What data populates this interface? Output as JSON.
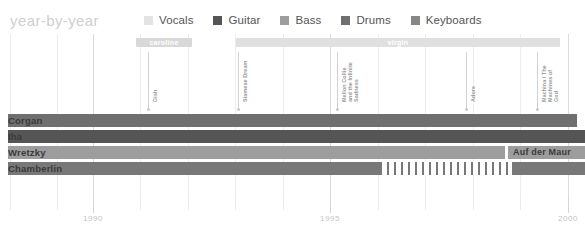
{
  "header": {
    "title": "year-by-year",
    "legend": [
      {
        "label": "Vocals",
        "color": "#e3e3e3"
      },
      {
        "label": "Guitar",
        "color": "#555555"
      },
      {
        "label": "Bass",
        "color": "#9d9d9d"
      },
      {
        "label": "Drums",
        "color": "#6f6f6f"
      },
      {
        "label": "Keyboards",
        "color": "#878787"
      }
    ]
  },
  "labels_bars": [
    {
      "name": "caroline",
      "x": 136,
      "width": 56,
      "color": "#d8d8d8"
    },
    {
      "name": "virgin",
      "x": 236,
      "width": 324,
      "color": "#e0e0e0"
    }
  ],
  "albums": [
    {
      "title": "Gish",
      "x": 148,
      "y_text": 56,
      "lines": 1
    },
    {
      "title": "Siamese Dream",
      "x": 238,
      "y_text": 56,
      "lines": 1
    },
    {
      "title": "Mellon Collie and the Infinite Sadness",
      "x": 337,
      "y_text": 56,
      "lines": 2
    },
    {
      "title": "Adore",
      "x": 466,
      "y_text": 56,
      "lines": 1
    },
    {
      "title": "Machina / The Machines of God",
      "x": 537,
      "y_text": 56,
      "lines": 2
    }
  ],
  "members": [
    {
      "name": "Corgan",
      "y": 80,
      "color": "#6f6f6f",
      "segments": [
        {
          "x": 8,
          "width": 569,
          "color": "#6f6f6f",
          "style": "solid"
        }
      ]
    },
    {
      "name": "Iha",
      "y": 96,
      "color": "#555555",
      "segments": [
        {
          "x": 8,
          "width": 577,
          "color": "#555555",
          "style": "solid"
        }
      ]
    },
    {
      "name": "Wretzky",
      "y": 112,
      "color": "#9d9d9d",
      "segments": [
        {
          "x": 8,
          "width": 497,
          "color": "#9d9d9d",
          "style": "solid"
        },
        {
          "x": 508,
          "width": 77,
          "color": "#9d9d9d",
          "style": "solid",
          "label": "Auf der Maur"
        }
      ]
    },
    {
      "name": "Chamberlin",
      "y": 128,
      "color": "#787878",
      "segments": [
        {
          "x": 8,
          "width": 372,
          "color": "#787878",
          "style": "solid"
        },
        {
          "x": 380,
          "width": 130,
          "color": "#787878",
          "style": "hatch"
        },
        {
          "x": 512,
          "width": 73,
          "color": "#787878",
          "style": "solid"
        }
      ]
    }
  ],
  "axis": {
    "ticks": [
      {
        "x": 10,
        "major": false,
        "label": ""
      },
      {
        "x": 57,
        "major": false,
        "label": ""
      },
      {
        "x": 93,
        "major": true,
        "label": "1990"
      },
      {
        "x": 140,
        "major": false,
        "label": ""
      },
      {
        "x": 188,
        "major": false,
        "label": ""
      },
      {
        "x": 235,
        "major": false,
        "label": ""
      },
      {
        "x": 283,
        "major": false,
        "label": ""
      },
      {
        "x": 330,
        "major": true,
        "label": "1995"
      },
      {
        "x": 378,
        "major": false,
        "label": ""
      },
      {
        "x": 425,
        "major": false,
        "label": ""
      },
      {
        "x": 473,
        "major": false,
        "label": ""
      },
      {
        "x": 520,
        "major": false,
        "label": ""
      },
      {
        "x": 568,
        "major": true,
        "label": "2000"
      }
    ]
  },
  "chart_data": {
    "type": "bar",
    "title": "year-by-year",
    "xlabel": "",
    "ylabel": "",
    "xlim": [
      1988.25,
      2000.5
    ],
    "categories": [
      "Corgan",
      "Iha",
      "Wretzky",
      "Chamberlin"
    ],
    "series": [
      {
        "name": "Corgan",
        "role": "Vocals / Guitar",
        "start": 1988.3,
        "end": 2000.3
      },
      {
        "name": "Iha",
        "role": "Guitar",
        "start": 1988.3,
        "end": 2000.5
      },
      {
        "name": "Wretzky",
        "role": "Bass",
        "start": 1988.3,
        "end": 1999.6
      },
      {
        "name": "Auf der Maur",
        "role": "Bass",
        "start": 1999.85,
        "end": 2000.5
      },
      {
        "name": "Chamberlin",
        "role": "Drums",
        "start": 1988.3,
        "end": 1996.3
      },
      {
        "name": "Chamberlin (hiatus)",
        "role": "Drums",
        "start": 1996.5,
        "end": 1999.2,
        "style": "hatch"
      },
      {
        "name": "Chamberlin",
        "role": "Drums",
        "start": 1999.9,
        "end": 2000.5
      }
    ],
    "annotations": [
      {
        "text": "caroline",
        "type": "record-label",
        "start": 1990.9,
        "end": 1992.1
      },
      {
        "text": "virgin",
        "type": "record-label",
        "start": 1993.0,
        "end": 2000.0
      },
      {
        "text": "Gish",
        "type": "album",
        "year": 1991.15
      },
      {
        "text": "Siamese Dream",
        "type": "album",
        "year": 1993.05
      },
      {
        "text": "Mellon Collie and the Infinite Sadness",
        "type": "album",
        "year": 1995.15
      },
      {
        "text": "Adore",
        "type": "album",
        "year": 1997.85
      },
      {
        "text": "Machina / The Machines of God",
        "type": "album",
        "year": 1999.35
      }
    ],
    "grid": true,
    "legend_position": "top"
  }
}
